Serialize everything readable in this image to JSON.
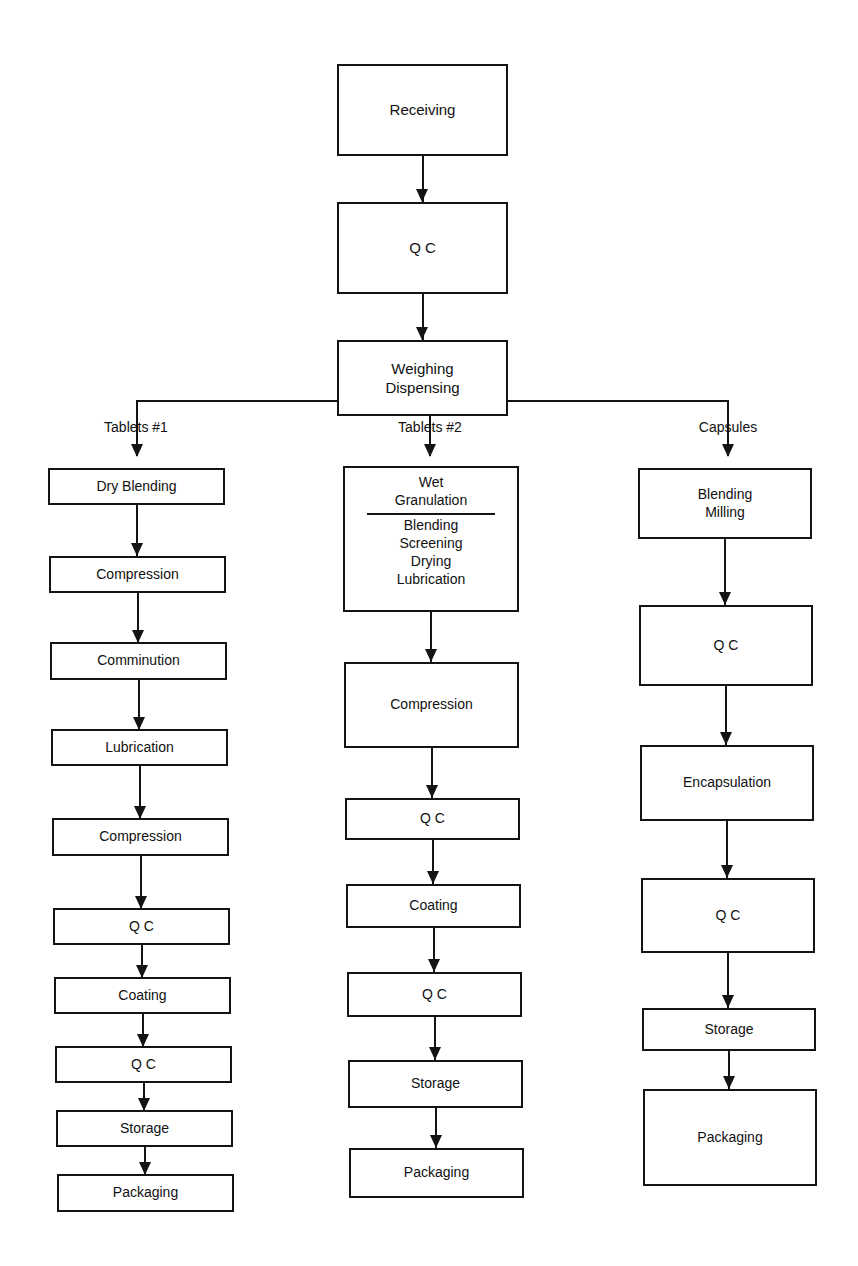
{
  "diagram": {
    "ink_color": "#141414",
    "background_color": "#ffffff"
  },
  "trunk": {
    "nodes": [
      {
        "id": "receiving",
        "label": "Receiving"
      },
      {
        "id": "qc_top",
        "label": "Q C"
      },
      {
        "id": "weighing",
        "label_line1": "Weighing",
        "label_line2": "Dispensing"
      }
    ]
  },
  "branches": [
    {
      "id": "tablets1",
      "label": "Tablets #1"
    },
    {
      "id": "tablets2",
      "label": "Tablets #2"
    },
    {
      "id": "capsules",
      "label": "Capsules"
    }
  ],
  "columns": {
    "tablets1": {
      "label": "Tablets #1",
      "nodes": [
        {
          "label": "Dry Blending"
        },
        {
          "label": "Compression"
        },
        {
          "label": "Comminution"
        },
        {
          "label": "Lubrication"
        },
        {
          "label": "Compression"
        },
        {
          "label": "Q C"
        },
        {
          "label": "Coating"
        },
        {
          "label": "Q C"
        },
        {
          "label": "Storage"
        },
        {
          "label": "Packaging"
        }
      ]
    },
    "tablets2": {
      "label": "Tablets #2",
      "wet_granulation": {
        "head_line1": "Wet",
        "head_line2": "Granulation",
        "sub_items": [
          "Blending",
          "Screening",
          "Drying",
          "Lubrication"
        ]
      },
      "nodes": [
        {
          "label": "Compression"
        },
        {
          "label": "Q C"
        },
        {
          "label": "Coating"
        },
        {
          "label": "Q C"
        },
        {
          "label": "Storage"
        },
        {
          "label": "Packaging"
        }
      ]
    },
    "capsules": {
      "label": "Capsules",
      "nodes": [
        {
          "label_line1": "Blending",
          "label_line2": "Milling"
        },
        {
          "label": "Q C"
        },
        {
          "label": "Encapsulation"
        },
        {
          "label": "Q C"
        },
        {
          "label": "Storage"
        },
        {
          "label": "Packaging"
        }
      ]
    }
  }
}
